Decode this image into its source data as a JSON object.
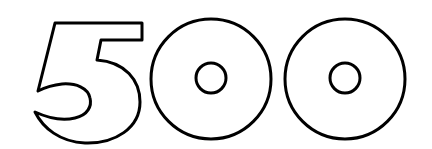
{
  "graphic": {
    "text": "500",
    "style": "outlined-numerals",
    "stroke_color": "#000000",
    "fill_color": "#ffffff",
    "background": "#ffffff"
  }
}
